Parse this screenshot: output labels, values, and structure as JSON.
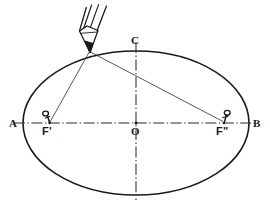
{
  "figure": {
    "caption": "",
    "colors": {
      "ink": "#1b1b1b",
      "axis": "#2a2a2a",
      "thread": "#3a3a3a",
      "background": "#ffffff",
      "caption": "#c9c9c9"
    }
  },
  "labels": {
    "vertex_left": "A",
    "vertex_right": "B",
    "co_vertex_top": "C",
    "center": "O",
    "focus_left": "F'",
    "focus_right": "F\""
  },
  "geometry": {
    "ellipse": {
      "cx": 136,
      "cy": 123,
      "rx": 113,
      "ry": 72
    },
    "major_axis": {
      "x1": 14,
      "y1": 123,
      "x2": 258,
      "y2": 123
    },
    "minor_axis": {
      "x1": 136,
      "y1": 42,
      "x2": 136,
      "y2": 200
    },
    "focus_left": {
      "x": 49,
      "y": 123
    },
    "focus_right": {
      "x": 224,
      "y": 123
    },
    "pencil_point": {
      "x": 89,
      "y": 51
    },
    "center_point": {
      "x": 136,
      "y": 123
    }
  },
  "icons": {
    "pencil": "pencil-icon",
    "pin_left": "pin-icon",
    "pin_right": "pin-icon"
  }
}
